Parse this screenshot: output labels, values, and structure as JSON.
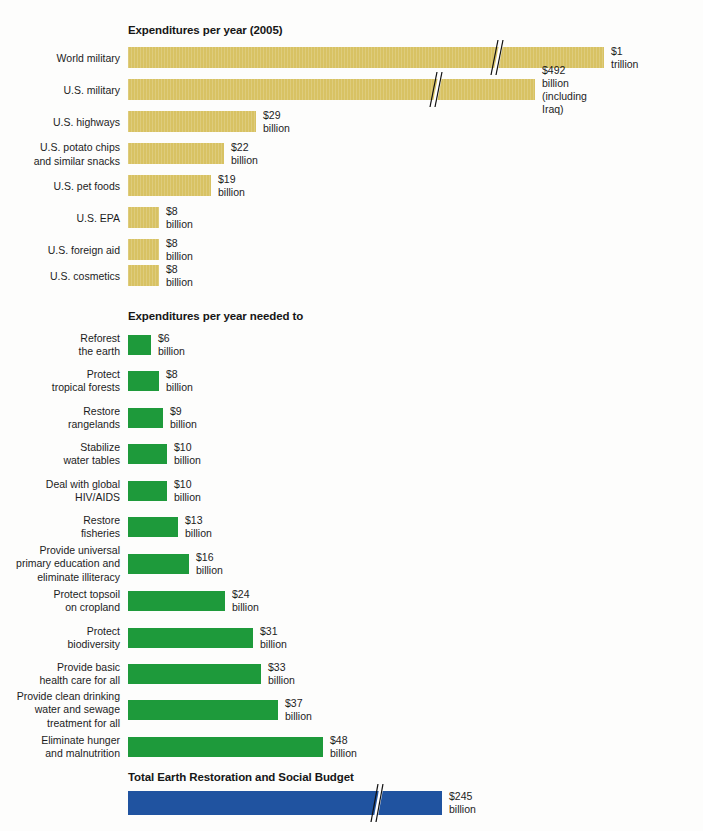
{
  "chart_data": {
    "type": "bar",
    "orientation": "horizontal",
    "xlabel": "",
    "ylabel": "",
    "note": "Bars for World military and U.S. military and the Total bar are drawn with an axis-break (zigzag) mark because their values exceed the plotted scale.",
    "sections": [
      {
        "id": "expenditures",
        "heading": "Expenditures per year (2005)",
        "color": "#d8c263",
        "categories": [
          "World military",
          "U.S. military",
          "U.S. highways",
          "U.S. potato chips and similar snacks",
          "U.S. pet foods",
          "U.S. EPA",
          "U.S. foreign aid",
          "U.S. cosmetics"
        ],
        "values": [
          1000,
          492,
          29,
          22,
          19,
          8,
          8,
          8
        ],
        "value_labels": [
          "$1 trillion",
          "$492 billion\n(including Iraq)",
          "$29 billion",
          "$22 billion",
          "$19 billion",
          "$8 billion",
          "$8 billion",
          "$8 billion"
        ]
      },
      {
        "id": "needed",
        "heading": "Expenditures per year needed to",
        "color": "#1e9a3b",
        "categories": [
          "Reforest\nthe earth",
          "Protect\ntropical forests",
          "Restore\nrangelands",
          "Stabilize\nwater tables",
          "Deal with global\nHIV/AIDS",
          "Restore\nfisheries",
          "Provide universal\nprimary education and\neliminate illiteracy",
          "Protect topsoil\non cropland",
          "Protect\nbiodiversity",
          "Provide basic\nhealth care for all",
          "Provide clean drinking\nwater and sewage\ntreatment for all",
          "Eliminate hunger\nand malnutrition"
        ],
        "values": [
          6,
          8,
          9,
          10,
          10,
          13,
          16,
          24,
          31,
          33,
          37,
          48
        ],
        "value_labels": [
          "$6 billion",
          "$8 billion",
          "$9 billion",
          "$10 billion",
          "$10 billion",
          "$13 billion",
          "$16 billion",
          "$24 billion",
          "$31 billion",
          "$33 billion",
          "$37 billion",
          "$48 billion"
        ]
      },
      {
        "id": "total",
        "heading": "Total Earth Restoration and Social Budget",
        "color": "#2053a0",
        "categories": [
          ""
        ],
        "values": [
          245
        ],
        "value_labels": [
          "$245 billion"
        ]
      }
    ]
  },
  "rows_expenditures": [
    {
      "label": "World military",
      "value_label": "$1 trillion",
      "bar_px": 476,
      "break_px": 370,
      "top": 47
    },
    {
      "label": "U.S. military",
      "value_label": "$492 billion\n(including Iraq)",
      "bar_px": 407,
      "break_px": 309,
      "top": 79
    },
    {
      "label": "U.S. highways",
      "value_label": "$29 billion",
      "bar_px": 128,
      "break_px": null,
      "top": 111
    },
    {
      "label": "U.S. potato chips\nand similar snacks",
      "value_label": "$22 billion",
      "bar_px": 96,
      "break_px": null,
      "top": 143
    },
    {
      "label": "U.S. pet foods",
      "value_label": "$19 billion",
      "bar_px": 83,
      "break_px": null,
      "top": 175
    },
    {
      "label": "U.S. EPA",
      "value_label": "$8 billion",
      "bar_px": 31,
      "break_px": null,
      "top": 207
    },
    {
      "label": "U.S. foreign aid",
      "value_label": "$8 billion",
      "bar_px": 31,
      "break_px": null,
      "top": 239
    },
    {
      "label": "U.S. cosmetics",
      "value_label": "$8 billion",
      "bar_px": 31,
      "break_px": null,
      "top": 265
    }
  ],
  "rows_needed": [
    {
      "label": "Reforest\nthe earth",
      "value_label": "$6 billion",
      "bar_px": 23,
      "top": 335
    },
    {
      "label": "Protect\ntropical forests",
      "value_label": "$8 billion",
      "bar_px": 31,
      "top": 371
    },
    {
      "label": "Restore\nrangelands",
      "value_label": "$9 billion",
      "bar_px": 35,
      "top": 408
    },
    {
      "label": "Stabilize\nwater tables",
      "value_label": "$10 billion",
      "bar_px": 39,
      "top": 444
    },
    {
      "label": "Deal with global\nHIV/AIDS",
      "value_label": "$10 billion",
      "bar_px": 39,
      "top": 481
    },
    {
      "label": "Restore\nfisheries",
      "value_label": "$13 billion",
      "bar_px": 50,
      "top": 517
    },
    {
      "label": "Provide universal\nprimary education and\neliminate illiteracy",
      "value_label": "$16 billion",
      "bar_px": 61,
      "top": 554
    },
    {
      "label": "Protect topsoil\non cropland",
      "value_label": "$24 billion",
      "bar_px": 97,
      "top": 591
    },
    {
      "label": "Protect\nbiodiversity",
      "value_label": "$31 billion",
      "bar_px": 125,
      "top": 628
    },
    {
      "label": "Provide basic\nhealth care for all",
      "value_label": "$33 billion",
      "bar_px": 133,
      "top": 664
    },
    {
      "label": "Provide clean drinking\nwater and sewage\ntreatment for all",
      "value_label": "$37 billion",
      "bar_px": 150,
      "top": 700
    },
    {
      "label": "Eliminate hunger\nand malnutrition",
      "value_label": "$48 billion",
      "bar_px": 195,
      "top": 737
    }
  ],
  "rows_total": [
    {
      "label": "",
      "value_label": "$245 billion",
      "bar_px": 314,
      "break_px": 250,
      "top": 791
    }
  ],
  "headings": {
    "expenditures": "Expenditures per year (2005)",
    "needed": "Expenditures per year needed to",
    "total": "Total Earth Restoration and Social Budget"
  },
  "colors": {
    "gold": "#d8c263",
    "green": "#1e9a3b",
    "blue": "#2053a0",
    "text": "#1c1c1c",
    "background": "#fdfdfc"
  }
}
